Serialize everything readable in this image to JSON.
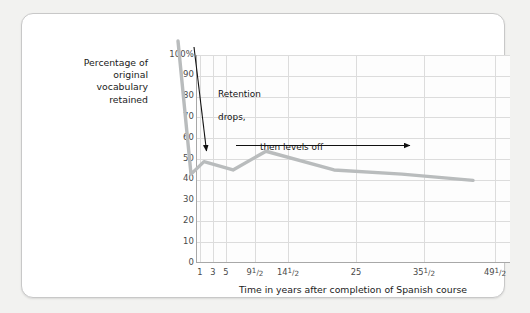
{
  "chart_data": {
    "type": "line",
    "title": "",
    "xlabel": "Time in years after completion of Spanish course",
    "ylabel": "Percentage of original vocabulary retained",
    "ylim": [
      0,
      100
    ],
    "grid": true,
    "legend": "none",
    "x_tick_labels": [
      "1",
      "3",
      "5",
      "9½",
      "14½",
      "25",
      "35½",
      "49½"
    ],
    "y_tick_labels": [
      "0",
      "10",
      "20",
      "30",
      "40",
      "50",
      "60",
      "70",
      "80",
      "90",
      "100%"
    ],
    "x": [
      1,
      3,
      5,
      9.5,
      14.5,
      25,
      35.5,
      49.5
    ],
    "values": [
      100,
      36,
      42,
      38,
      47,
      38,
      36,
      33
    ],
    "series": [
      {
        "name": "Percentage of original vocabulary retained",
        "values": [
          100,
          36,
          42,
          38,
          47,
          38,
          36,
          33
        ],
        "color": "#b9bcbd"
      }
    ],
    "annotations": [
      {
        "text": "Retention\ndrops,",
        "arrow": "down-right-to-curve"
      },
      {
        "text": "then levels off",
        "arrow": "right"
      }
    ]
  },
  "axis": {
    "y_label_lines": [
      "Percentage of",
      "original vocabulary",
      "retained"
    ],
    "y_ticks": [
      {
        "label": "100%",
        "value": 100
      },
      {
        "label": "90",
        "value": 90
      },
      {
        "label": "80",
        "value": 80
      },
      {
        "label": "70",
        "value": 70
      },
      {
        "label": "60",
        "value": 60
      },
      {
        "label": "50",
        "value": 50
      },
      {
        "label": "40",
        "value": 40
      },
      {
        "label": "30",
        "value": 30
      },
      {
        "label": "20",
        "value": 20
      },
      {
        "label": "10",
        "value": 10
      },
      {
        "label": "0",
        "value": 0
      }
    ],
    "x_ticks": [
      {
        "label": "1",
        "whole": "1",
        "num": "",
        "den": ""
      },
      {
        "label": "3",
        "whole": "3",
        "num": "",
        "den": ""
      },
      {
        "label": "5",
        "whole": "5",
        "num": "",
        "den": ""
      },
      {
        "label": "9½",
        "whole": "9",
        "num": "1",
        "den": "2"
      },
      {
        "label": "14½",
        "whole": "14",
        "num": "1",
        "den": "2"
      },
      {
        "label": "25",
        "whole": "25",
        "num": "",
        "den": ""
      },
      {
        "label": "35½",
        "whole": "35",
        "num": "1",
        "den": "2"
      },
      {
        "label": "49½",
        "whole": "49",
        "num": "1",
        "den": "2"
      }
    ],
    "x_title": "Time in years after completion of Spanish course"
  },
  "annotations": {
    "retention_line1": "Retention",
    "retention_line2": "drops,",
    "levels_off": "then levels off"
  },
  "colors": {
    "line": "#b9bcbd",
    "grid": "#dcdcdc",
    "axis": "#a8a8a8",
    "text": "#1a1a1a",
    "tick_text": "#4a4a4a",
    "card_bg": "#ffffff",
    "page_bg": "#f2f2f0",
    "annotation_arrow": "#111111"
  }
}
